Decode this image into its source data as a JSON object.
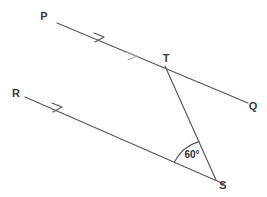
{
  "figure": {
    "background_color": "#ffffff",
    "line_color": "#55555f",
    "label_color": "#3a3a42",
    "faded_mark_color": "#a9a9b2"
  },
  "labels": {
    "p": "P",
    "q": "Q",
    "r": "R",
    "s": "S",
    "t": "T",
    "angle": "60°"
  },
  "points": {
    "P": {
      "x": 57,
      "y": 23
    },
    "Q": {
      "x": 248,
      "y": 103
    },
    "R": {
      "x": 25,
      "y": 97
    },
    "S": {
      "x": 216,
      "y": 180
    },
    "T": {
      "x": 165,
      "y": 66
    }
  },
  "label_positions": {
    "P": {
      "x": 44,
      "y": 20
    },
    "Q": {
      "x": 251,
      "y": 110
    },
    "R": {
      "x": 13,
      "y": 97
    },
    "S": {
      "x": 220,
      "y": 189
    },
    "T": {
      "x": 162,
      "y": 62
    },
    "angle": {
      "x": 192,
      "y": 158
    }
  },
  "segments": [
    {
      "name": "ray-pq",
      "from": "P",
      "to": "Q",
      "via": "T"
    },
    {
      "name": "ray-rs",
      "from": "R",
      "to": "S-extended"
    },
    {
      "name": "segment-ts",
      "from": "T",
      "to": "S"
    }
  ],
  "arrow_marks": [
    {
      "name": "arrowhead-pq",
      "x": 101,
      "y": 41,
      "state": "solid"
    },
    {
      "name": "arrowhead-pq-second",
      "x": 133,
      "y": 55,
      "state": "faded"
    },
    {
      "name": "arrowhead-rs",
      "x": 59,
      "y": 111,
      "state": "solid"
    }
  ],
  "angle_arc": {
    "vertex": "S",
    "measure_degrees": 60,
    "radius": 42
  }
}
